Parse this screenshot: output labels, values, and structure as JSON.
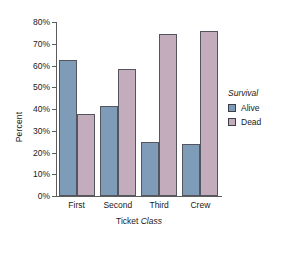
{
  "chart_data": {
    "type": "bar",
    "title": "",
    "xlabel": "Ticket Class",
    "xlabel_plain": "Ticket",
    "xlabel_emphasis": "Class",
    "ylabel": "Percent",
    "ylim": [
      0,
      80
    ],
    "ytick_step": 10,
    "grid": false,
    "legend_position": "right",
    "legend_title": "Survival",
    "categories": [
      "First",
      "Second",
      "Third",
      "Crew"
    ],
    "ytick_labels": [
      "80%",
      "70%",
      "60%",
      "50%",
      "40%",
      "30%",
      "20%",
      "10%",
      "0%"
    ],
    "ytick_values": [
      80,
      70,
      60,
      50,
      40,
      30,
      20,
      10,
      0
    ],
    "series": [
      {
        "name": "Alive",
        "color": "#7e9cb8",
        "values": [
          62.5,
          41.5,
          25.0,
          24.0
        ]
      },
      {
        "name": "Dead",
        "color": "#c3adbd",
        "values": [
          37.5,
          58.5,
          74.5,
          76.0
        ]
      }
    ]
  },
  "colors": {
    "alive": "#7e9cb8",
    "dead": "#c3adbd",
    "axis": "#5c5c5c",
    "bar_border": "#55555f",
    "background": "#ffffff"
  }
}
